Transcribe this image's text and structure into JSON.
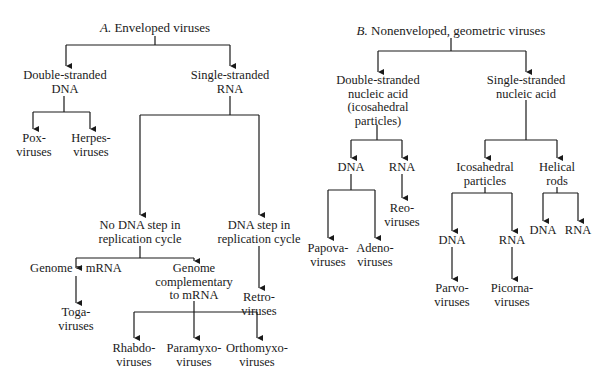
{
  "diagram": {
    "type": "classification-tree",
    "trees": [
      {
        "id": "A",
        "title_letter": "A.",
        "title_text": "Enveloped viruses",
        "children": [
          {
            "label": [
              "Double-stranded",
              "DNA"
            ],
            "children": [
              {
                "label": [
                  "Pox-",
                  "viruses"
                ]
              },
              {
                "label": [
                  "Herpes-",
                  "viruses"
                ]
              }
            ]
          },
          {
            "label": [
              "Single-stranded",
              "RNA"
            ],
            "children": [
              {
                "label": [
                  "No DNA step in",
                  "replication cycle"
                ],
                "children": [
                  {
                    "label": [
                      "Genome = mRNA"
                    ],
                    "children": [
                      {
                        "label": [
                          "Toga-",
                          "viruses"
                        ]
                      }
                    ]
                  },
                  {
                    "label": [
                      "Genome",
                      "complementary",
                      "to mRNA"
                    ],
                    "children": [
                      {
                        "label": [
                          "Rhabdo-",
                          "viruses"
                        ]
                      },
                      {
                        "label": [
                          "Paramyxo-",
                          "viruses"
                        ]
                      },
                      {
                        "label": [
                          "Orthomyxo-",
                          "viruses"
                        ]
                      }
                    ]
                  }
                ]
              },
              {
                "label": [
                  "DNA step in",
                  "replication cycle"
                ],
                "children": [
                  {
                    "label": [
                      "Retro-",
                      "viruses"
                    ]
                  }
                ]
              }
            ]
          }
        ]
      },
      {
        "id": "B",
        "title_letter": "B.",
        "title_text": "Nonenveloped, geometric viruses",
        "children": [
          {
            "label": [
              "Double-stranded",
              "nucleic acid",
              "(icosahedral",
              "particles)"
            ],
            "children": [
              {
                "label": [
                  "DNA"
                ],
                "children": [
                  {
                    "label": [
                      "Papova-",
                      "viruses"
                    ]
                  },
                  {
                    "label": [
                      "Adeno-",
                      "viruses"
                    ]
                  }
                ]
              },
              {
                "label": [
                  "RNA"
                ],
                "children": [
                  {
                    "label": [
                      "Reo-",
                      "viruses"
                    ]
                  }
                ]
              }
            ]
          },
          {
            "label": [
              "Single-stranded",
              "nucleic acid"
            ],
            "children": [
              {
                "label": [
                  "Icosahedral",
                  "particles"
                ],
                "children": [
                  {
                    "label": [
                      "DNA"
                    ],
                    "children": [
                      {
                        "label": [
                          "Parvo-",
                          "viruses"
                        ]
                      }
                    ]
                  },
                  {
                    "label": [
                      "RNA"
                    ],
                    "children": [
                      {
                        "label": [
                          "Picorna-",
                          "viruses"
                        ]
                      }
                    ]
                  }
                ]
              },
              {
                "label": [
                  "Helical",
                  "rods"
                ],
                "children": [
                  {
                    "label": [
                      "DNA"
                    ]
                  },
                  {
                    "label": [
                      "RNA"
                    ]
                  }
                ]
              }
            ]
          }
        ]
      }
    ]
  },
  "labels": {
    "a_title_letter": "A.",
    "a_title_text": " Enveloped viruses",
    "a_ds_dna": [
      "Double-stranded",
      "DNA"
    ],
    "a_ss_rna": [
      "Single-stranded",
      "RNA"
    ],
    "a_pox": [
      "Pox-",
      "viruses"
    ],
    "a_herpes": [
      "Herpes-",
      "viruses"
    ],
    "a_no_dna_step": [
      "No DNA step in",
      "replication cycle"
    ],
    "a_dna_step": [
      "DNA step in",
      "replication cycle"
    ],
    "a_retro": [
      "Retro-",
      "viruses"
    ],
    "a_genome_mrna": [
      "Genome = mRNA"
    ],
    "a_genome_comp": [
      "Genome",
      "complementary",
      "to mRNA"
    ],
    "a_toga": [
      "Toga-",
      "viruses"
    ],
    "a_rhabdo": [
      "Rhabdo-",
      "viruses"
    ],
    "a_paramyxo": [
      "Paramyxo-",
      "viruses"
    ],
    "a_orthomyxo": [
      "Orthomyxo-",
      "viruses"
    ],
    "b_title_letter": "B.",
    "b_title_text": " Nonenveloped, geometric viruses",
    "b_ds_na": [
      "Double-stranded",
      "nucleic acid",
      "(icosahedral",
      "particles)"
    ],
    "b_ss_na": [
      "Single-stranded",
      "nucleic acid"
    ],
    "b_ds_dna": [
      "DNA"
    ],
    "b_ds_rna": [
      "RNA"
    ],
    "b_papova": [
      "Papova-",
      "viruses"
    ],
    "b_adeno": [
      "Adeno-",
      "viruses"
    ],
    "b_reo": [
      "Reo-",
      "viruses"
    ],
    "b_icosahedral": [
      "Icosahedral",
      "particles"
    ],
    "b_helical": [
      "Helical",
      "rods"
    ],
    "b_icos_dna": [
      "DNA"
    ],
    "b_icos_rna": [
      "RNA"
    ],
    "b_parvo": [
      "Parvo-",
      "viruses"
    ],
    "b_picorna": [
      "Picorna-",
      "viruses"
    ],
    "b_hel_dna": [
      "DNA"
    ],
    "b_hel_rna": [
      "RNA"
    ]
  },
  "colors": {
    "line": "#1a1a1a",
    "text": "#1a1a1a",
    "background": "#ffffff"
  }
}
